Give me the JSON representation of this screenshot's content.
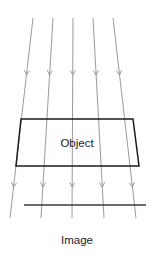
{
  "figure": {
    "name": "orthographic-projection-diagram",
    "labels": {
      "object": "Object",
      "image": "Image"
    },
    "colors": {
      "ray": "#8e8e8e",
      "object_outline": "#1c1c1c",
      "image_plane": "#3a3a3a",
      "text": "#1c1c1c",
      "background": "#ffffff"
    },
    "rays": [
      {
        "id": "ray-1",
        "x1": 33,
        "y1": 18,
        "x2": 10,
        "y2": 218
      },
      {
        "id": "ray-2",
        "x1": 53,
        "y1": 18,
        "x2": 41,
        "y2": 218
      },
      {
        "id": "ray-3",
        "x1": 73,
        "y1": 18,
        "x2": 72,
        "y2": 218
      },
      {
        "id": "ray-4",
        "x1": 93,
        "y1": 18,
        "x2": 104,
        "y2": 218
      },
      {
        "id": "ray-5",
        "x1": 113,
        "y1": 18,
        "x2": 136,
        "y2": 218
      }
    ],
    "arrow_rows": [
      {
        "id": "arrow-row-upper",
        "t": 0.285
      },
      {
        "id": "arrow-row-lower",
        "t": 0.845
      }
    ],
    "object_quad": {
      "top_left": {
        "x": 21,
        "y": 119
      },
      "top_right": {
        "x": 133,
        "y": 119
      },
      "bottom_right": {
        "x": 139,
        "y": 166
      },
      "bottom_left": {
        "x": 16,
        "y": 166
      }
    },
    "object_label_pos": {
      "x": 77,
      "y": 147
    },
    "image_plane_line": {
      "x1": 24,
      "y1": 205,
      "x2": 146,
      "y2": 205
    },
    "image_label_pos": {
      "x": 77,
      "y": 244
    }
  }
}
